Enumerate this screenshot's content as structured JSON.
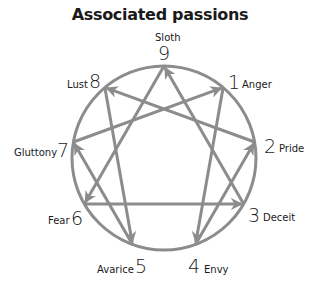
{
  "title": "Associated passions",
  "colors": {
    "line": "#8c8c8c",
    "text": "#1a1a1a"
  },
  "points": [
    {
      "number": "9",
      "passion": "Sloth"
    },
    {
      "number": "1",
      "passion": "Anger"
    },
    {
      "number": "2",
      "passion": "Pride"
    },
    {
      "number": "3",
      "passion": "Deceit"
    },
    {
      "number": "4",
      "passion": "Envy"
    },
    {
      "number": "5",
      "passion": "Avarice"
    },
    {
      "number": "6",
      "passion": "Fear"
    },
    {
      "number": "7",
      "passion": "Gluttony"
    },
    {
      "number": "8",
      "passion": "Lust"
    }
  ],
  "arrows": [
    {
      "from": "3",
      "to": "9"
    },
    {
      "from": "9",
      "to": "6"
    },
    {
      "from": "6",
      "to": "3"
    },
    {
      "from": "1",
      "to": "4"
    },
    {
      "from": "4",
      "to": "2"
    },
    {
      "from": "2",
      "to": "8"
    },
    {
      "from": "8",
      "to": "5"
    },
    {
      "from": "5",
      "to": "7"
    },
    {
      "from": "7",
      "to": "1"
    }
  ]
}
